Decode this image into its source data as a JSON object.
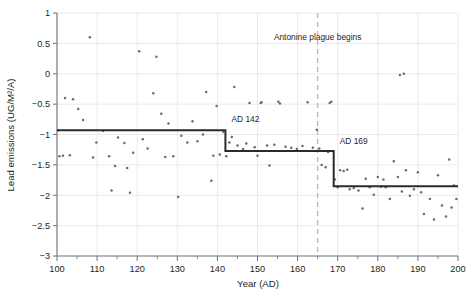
{
  "chart_data": {
    "type": "scatter",
    "title": "",
    "xlabel": "Year (AD)",
    "ylabel": "Lead emissions (UG/M²/A)",
    "xlim": [
      100,
      200
    ],
    "ylim": [
      -3,
      1
    ],
    "xticks": [
      100,
      110,
      120,
      130,
      140,
      150,
      160,
      170,
      180,
      190,
      200
    ],
    "xtick_labels": [
      "100",
      "110",
      "120",
      "130",
      "140",
      "150",
      "160",
      "170",
      "180",
      "190",
      "200"
    ],
    "xtick_minor_step": 5,
    "yticks": [
      1,
      0.5,
      0,
      -0.5,
      -1,
      -1.5,
      -2,
      -2.5,
      -3
    ],
    "ytick_labels": [
      "1",
      "0.5",
      "0",
      "−0.5",
      "−1",
      "−1.5",
      "−2",
      "−2.5",
      "−3"
    ],
    "grid": true,
    "grid_color": "#e8e8ea",
    "point_color": "#6a6a70",
    "legend": "none",
    "points": [
      [
        100.3,
        -0.93
      ],
      [
        100.6,
        -1.36
      ],
      [
        101.5,
        -1.35
      ],
      [
        102.0,
        -0.4
      ],
      [
        103.2,
        -1.34
      ],
      [
        104.0,
        -0.42
      ],
      [
        105.3,
        -0.58
      ],
      [
        106.5,
        -0.76
      ],
      [
        108.2,
        0.6
      ],
      [
        109.0,
        -1.38
      ],
      [
        109.8,
        -1.13
      ],
      [
        111.5,
        -0.94
      ],
      [
        113.0,
        -1.36
      ],
      [
        113.6,
        -1.92
      ],
      [
        114.5,
        -1.52
      ],
      [
        115.2,
        -1.05
      ],
      [
        116.8,
        -1.14
      ],
      [
        117.5,
        -1.55
      ],
      [
        118.2,
        -1.96
      ],
      [
        119.0,
        -1.3
      ],
      [
        120.5,
        0.37
      ],
      [
        121.4,
        -1.08
      ],
      [
        122.6,
        -1.23
      ],
      [
        124.0,
        -0.32
      ],
      [
        124.8,
        0.28
      ],
      [
        126.0,
        -0.66
      ],
      [
        127.0,
        -1.37
      ],
      [
        127.8,
        -0.82
      ],
      [
        129.0,
        -1.36
      ],
      [
        130.2,
        -2.03
      ],
      [
        131.0,
        -1.02
      ],
      [
        132.5,
        -1.13
      ],
      [
        133.8,
        -0.78
      ],
      [
        135.0,
        -1.11
      ],
      [
        136.4,
        -1.0
      ],
      [
        137.2,
        -0.3
      ],
      [
        138.5,
        -1.76
      ],
      [
        139.0,
        -1.35
      ],
      [
        139.8,
        -0.53
      ],
      [
        140.6,
        -1.33
      ],
      [
        141.5,
        -0.96
      ],
      [
        142.2,
        -1.36
      ],
      [
        143.0,
        -1.13
      ],
      [
        144.2,
        -0.22
      ],
      [
        145.0,
        -1.18
      ],
      [
        146.4,
        -1.24
      ],
      [
        147.2,
        -1.15
      ],
      [
        148.0,
        -0.48
      ],
      [
        149.3,
        -1.21
      ],
      [
        150.0,
        -1.35
      ],
      [
        151.0,
        -0.47
      ],
      [
        152.4,
        -1.18
      ],
      [
        153.0,
        -1.51
      ],
      [
        154.2,
        -1.17
      ],
      [
        155.6,
        -0.49
      ],
      [
        157.0,
        -1.2
      ],
      [
        158.4,
        -1.22
      ],
      [
        159.8,
        -1.24
      ],
      [
        161.2,
        -1.19
      ],
      [
        162.5,
        -0.47
      ],
      [
        163.8,
        -1.22
      ],
      [
        164.8,
        -0.92
      ],
      [
        165.4,
        -1.23
      ],
      [
        166.0,
        -1.5
      ],
      [
        167.0,
        -1.54
      ],
      [
        167.6,
        -1.29
      ],
      [
        168.0,
        -0.48
      ],
      [
        168.4,
        -0.46
      ],
      [
        169.3,
        -1.74
      ],
      [
        170.0,
        -1.87
      ],
      [
        170.6,
        -1.59
      ],
      [
        171.5,
        -1.6
      ],
      [
        172.4,
        -1.58
      ],
      [
        173.0,
        -1.9
      ],
      [
        174.0,
        -1.88
      ],
      [
        175.2,
        -1.92
      ],
      [
        176.2,
        -2.22
      ],
      [
        177.0,
        -1.73
      ],
      [
        178.0,
        -1.87
      ],
      [
        179.0,
        -1.99
      ],
      [
        180.0,
        -1.7
      ],
      [
        180.8,
        -1.86
      ],
      [
        181.4,
        -1.74
      ],
      [
        182.0,
        -1.87
      ],
      [
        183.0,
        -2.06
      ],
      [
        184.0,
        -1.44
      ],
      [
        185.0,
        -1.7
      ],
      [
        186.0,
        -1.94
      ],
      [
        187.0,
        -1.59
      ],
      [
        188.0,
        -2.01
      ],
      [
        189.0,
        -1.9
      ],
      [
        190.0,
        -1.62
      ],
      [
        190.8,
        -1.95
      ],
      [
        191.5,
        -2.31
      ],
      [
        193.0,
        -2.06
      ],
      [
        194.0,
        -2.4
      ],
      [
        195.0,
        -1.67
      ],
      [
        196.0,
        -2.17
      ],
      [
        197.0,
        -2.35
      ],
      [
        197.8,
        -1.41
      ],
      [
        198.4,
        -2.2
      ],
      [
        199.0,
        -1.84
      ],
      [
        199.6,
        -2.06
      ],
      [
        186.5,
        0.0
      ],
      [
        185.5,
        -0.02
      ],
      [
        150.8,
        -0.48
      ],
      [
        155.2,
        -0.46
      ],
      [
        143.6,
        -1.04
      ]
    ],
    "step_segments": [
      {
        "x0": 100,
        "x1": 142,
        "y": -0.93
      },
      {
        "x0": 142,
        "x1": 169,
        "y": -1.27
      },
      {
        "x0": 169,
        "x1": 200,
        "y": -1.85
      }
    ],
    "annotations": [
      {
        "name": "step-label-142",
        "text": "AD 142",
        "x": 143.5,
        "y": -0.8
      },
      {
        "name": "step-label-169",
        "text": "AD 169",
        "x": 170.5,
        "y": -1.16
      },
      {
        "name": "event-label",
        "text": "Antonine plague begins",
        "x": 165,
        "y": 0.55
      }
    ],
    "event_marker": {
      "name": "antonine-plague-line",
      "x": 165,
      "style": "dashed",
      "color": "#bcbcbe"
    }
  }
}
